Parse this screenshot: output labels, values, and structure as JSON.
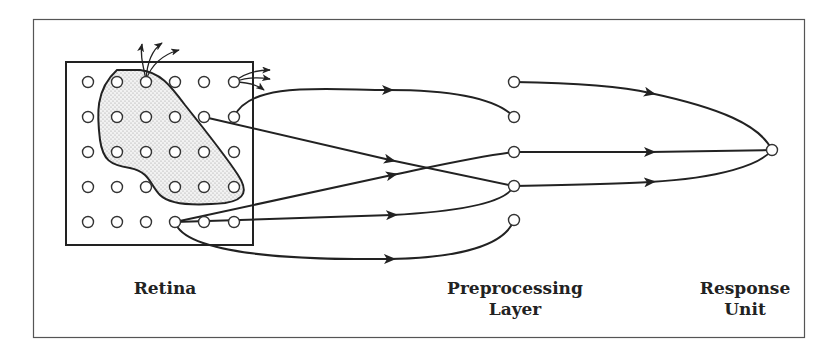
{
  "labels": {
    "retina": "Retina",
    "preprocessing_line1": "Preprocessing",
    "preprocessing_line2": "Layer",
    "response_line1": "Response",
    "response_line2": "Unit"
  },
  "colors": {
    "stroke": "#222222",
    "node_fill": "#ffffff",
    "blob_fill": "#e6e6e6",
    "background": "#ffffff"
  },
  "retina": {
    "rows": 5,
    "cols": 6,
    "highlighted_region": "stippled blob covering upper-left retina cells"
  },
  "preprocessing_layer": {
    "node_count": 5
  },
  "response_unit": {
    "node_count": 1
  }
}
